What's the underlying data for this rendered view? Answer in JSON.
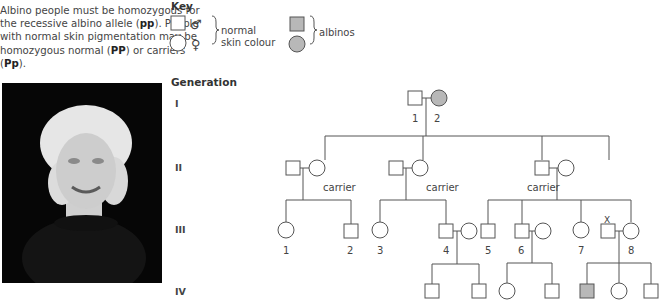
{
  "intro": {
    "part1": "Albino people must be homozygous for the recessive albino allele (",
    "pp": "pp",
    "part2": "). People with normal skin pigmentation may be homozygous normal (",
    "PP": "PP",
    "part3": ") or carriers (",
    "Pp": "Pp",
    "part4": ")."
  },
  "key": {
    "title": "Key",
    "male_symbol": "♂",
    "female_symbol": "♀",
    "normal_label_line1": "normal",
    "normal_label_line2": "skin colour",
    "albino_label": "albinos",
    "albino_fill": "#b8b8b8",
    "normal_fill": "#ffffff"
  },
  "photo": {
    "description": "Photograph of a person with albinism against a black background"
  },
  "generation": {
    "title": "Generation",
    "labels": [
      "I",
      "II",
      "III",
      "IV"
    ]
  },
  "pedigree": {
    "gen1": {
      "labels": [
        "1",
        "2"
      ]
    },
    "gen2": {
      "carrier_label": "carrier"
    },
    "gen3": {
      "labels": [
        "1",
        "2",
        "3",
        "4",
        "5",
        "6",
        "7",
        "8"
      ],
      "marker_x": "X"
    }
  }
}
